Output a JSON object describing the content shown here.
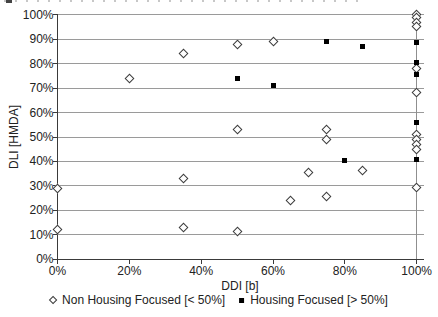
{
  "chart_data": {
    "type": "scatter",
    "title": "",
    "xlabel": "DDI [b]",
    "ylabel": "DLI [HMDA]",
    "xlim": [
      0,
      100
    ],
    "ylim": [
      0,
      100
    ],
    "x_tick_labels": [
      "0%",
      "20%",
      "40%",
      "60%",
      "80%",
      "100%"
    ],
    "x_tick_values": [
      0,
      20,
      40,
      60,
      80,
      100
    ],
    "y_tick_labels": [
      "0%",
      "10%",
      "20%",
      "30%",
      "40%",
      "50%",
      "60%",
      "70%",
      "80%",
      "90%",
      "100%"
    ],
    "y_tick_values": [
      0,
      10,
      20,
      30,
      40,
      50,
      60,
      70,
      80,
      90,
      100
    ],
    "grid": "horizontal gridlines at every 10%, vertical gridline at x=100%",
    "legend_position": "bottom-center",
    "series": [
      {
        "name": "Non Housing Focused [< 50%]",
        "marker": "open-diamond",
        "points": [
          [
            0,
            29
          ],
          [
            0,
            12
          ],
          [
            20,
            74
          ],
          [
            35,
            84
          ],
          [
            35,
            33
          ],
          [
            35,
            13
          ],
          [
            50,
            88
          ],
          [
            50,
            53
          ],
          [
            50,
            11.5
          ],
          [
            60,
            89
          ],
          [
            65,
            24
          ],
          [
            70,
            35.5
          ],
          [
            75,
            53
          ],
          [
            75,
            49
          ],
          [
            75,
            25.5
          ],
          [
            85,
            36.5
          ],
          [
            100,
            100
          ],
          [
            100,
            99
          ],
          [
            100,
            97
          ],
          [
            100,
            95
          ],
          [
            100,
            78
          ],
          [
            100,
            68
          ],
          [
            100,
            51
          ],
          [
            100,
            49
          ],
          [
            100,
            47
          ],
          [
            100,
            45
          ],
          [
            100,
            29.5
          ]
        ]
      },
      {
        "name": "Housing Focused [> 50%]",
        "marker": "filled-square",
        "points": [
          [
            50,
            74
          ],
          [
            60,
            71
          ],
          [
            75,
            89
          ],
          [
            80,
            40.5
          ],
          [
            85,
            87
          ],
          [
            100,
            88.5
          ],
          [
            100,
            80.5
          ],
          [
            100,
            75.5
          ],
          [
            100,
            56
          ],
          [
            100,
            41
          ]
        ]
      }
    ],
    "colors": {
      "marker": "#000000",
      "gridline": "#9a9a9a",
      "axis": "#3a3a3a",
      "background": "#ffffff"
    }
  }
}
